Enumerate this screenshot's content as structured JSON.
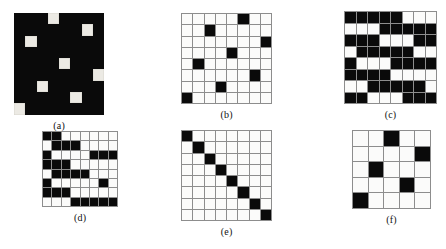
{
  "figure": {
    "background_color": "#ffffff",
    "cell_on_color": "#0a0a0a",
    "cell_off_color": "#fbfbfa",
    "grid_line_color": "#8d8d8d"
  },
  "panels": [
    {
      "id": "a",
      "caption": "(a)",
      "rows": 8,
      "cols": 8,
      "style": "solid",
      "cell_size": 11.3,
      "nnz": 56,
      "matrix": [
        [
          1,
          1,
          1,
          0,
          1,
          1,
          1,
          1
        ],
        [
          1,
          1,
          1,
          1,
          1,
          1,
          0,
          1
        ],
        [
          1,
          0,
          1,
          1,
          1,
          1,
          1,
          1
        ],
        [
          1,
          1,
          1,
          1,
          1,
          1,
          1,
          1
        ],
        [
          1,
          1,
          1,
          1,
          0,
          1,
          1,
          1
        ],
        [
          1,
          1,
          1,
          1,
          1,
          1,
          1,
          0
        ],
        [
          1,
          1,
          0,
          1,
          1,
          1,
          1,
          1
        ],
        [
          1,
          1,
          1,
          1,
          1,
          0,
          1,
          1
        ],
        [
          0,
          1,
          1,
          1,
          1,
          1,
          1,
          1
        ]
      ]
    },
    {
      "id": "b",
      "caption": "(b)",
      "rows": 8,
      "cols": 8,
      "style": "lined",
      "cell_size": 11.3,
      "nnz": 8,
      "matrix": [
        [
          0,
          0,
          0,
          0,
          0,
          1,
          0,
          0
        ],
        [
          0,
          0,
          1,
          0,
          0,
          0,
          0,
          0
        ],
        [
          0,
          0,
          0,
          0,
          0,
          0,
          0,
          1
        ],
        [
          0,
          0,
          0,
          0,
          1,
          0,
          0,
          0
        ],
        [
          0,
          1,
          0,
          0,
          0,
          0,
          0,
          0
        ],
        [
          0,
          0,
          0,
          0,
          0,
          0,
          1,
          0
        ],
        [
          0,
          0,
          0,
          1,
          0,
          0,
          0,
          0
        ],
        [
          1,
          0,
          0,
          0,
          0,
          0,
          0,
          0
        ]
      ]
    },
    {
      "id": "c",
      "caption": "(c)",
      "rows": 8,
      "cols": 8,
      "style": "lined",
      "cell_size": 11.5,
      "nnz": 40,
      "matrix": [
        [
          1,
          1,
          1,
          1,
          1,
          0,
          0,
          0
        ],
        [
          0,
          0,
          0,
          1,
          1,
          1,
          1,
          1
        ],
        [
          1,
          1,
          1,
          0,
          0,
          0,
          1,
          1
        ],
        [
          0,
          1,
          1,
          1,
          1,
          1,
          0,
          0
        ],
        [
          1,
          0,
          0,
          0,
          1,
          1,
          1,
          1
        ],
        [
          1,
          1,
          1,
          1,
          0,
          0,
          0,
          0
        ],
        [
          0,
          0,
          1,
          1,
          1,
          1,
          1,
          0
        ],
        [
          1,
          1,
          0,
          0,
          0,
          1,
          1,
          1
        ]
      ]
    },
    {
      "id": "d",
      "caption": "(d)",
      "rows": 8,
      "cols": 8,
      "style": "lined",
      "cell_size": 9.4,
      "nnz": 30,
      "matrix": [
        [
          1,
          1,
          0,
          0,
          0,
          0,
          0,
          0
        ],
        [
          0,
          1,
          1,
          1,
          0,
          0,
          0,
          0
        ],
        [
          1,
          0,
          0,
          0,
          0,
          1,
          1,
          1
        ],
        [
          1,
          1,
          1,
          0,
          0,
          0,
          0,
          0
        ],
        [
          0,
          1,
          1,
          1,
          1,
          0,
          0,
          0
        ],
        [
          1,
          0,
          0,
          0,
          0,
          0,
          1,
          0
        ],
        [
          1,
          1,
          1,
          0,
          0,
          0,
          0,
          0
        ],
        [
          0,
          0,
          0,
          1,
          1,
          1,
          1,
          1
        ]
      ]
    },
    {
      "id": "e",
      "caption": "(e)",
      "rows": 8,
      "cols": 8,
      "style": "lined",
      "cell_size": 11.3,
      "nnz": 8,
      "matrix": [
        [
          1,
          0,
          0,
          0,
          0,
          0,
          0,
          0
        ],
        [
          0,
          1,
          0,
          0,
          0,
          0,
          0,
          0
        ],
        [
          0,
          0,
          1,
          0,
          0,
          0,
          0,
          0
        ],
        [
          0,
          0,
          0,
          1,
          0,
          0,
          0,
          0
        ],
        [
          0,
          0,
          0,
          0,
          1,
          0,
          0,
          0
        ],
        [
          0,
          0,
          0,
          0,
          0,
          1,
          0,
          0
        ],
        [
          0,
          0,
          0,
          0,
          0,
          0,
          1,
          0
        ],
        [
          0,
          0,
          0,
          0,
          0,
          0,
          0,
          1
        ]
      ]
    },
    {
      "id": "f",
      "caption": "(f)",
      "rows": 5,
      "cols": 5,
      "style": "lined",
      "cell_size": 15.6,
      "nnz": 5,
      "matrix": [
        [
          0,
          0,
          1,
          0,
          0
        ],
        [
          0,
          0,
          0,
          0,
          1
        ],
        [
          0,
          1,
          0,
          0,
          0
        ],
        [
          0,
          0,
          0,
          1,
          0
        ],
        [
          1,
          0,
          0,
          0,
          0
        ]
      ]
    }
  ]
}
